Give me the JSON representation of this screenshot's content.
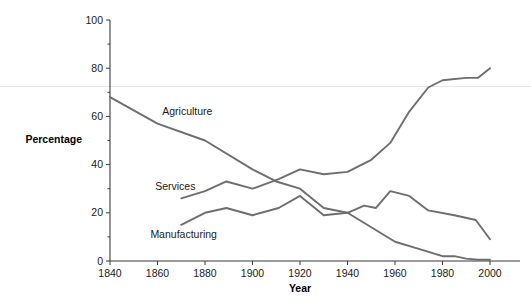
{
  "chart_data": {
    "type": "line",
    "title": "",
    "xlabel": "Year",
    "ylabel": "Percentage",
    "xlim": [
      1840,
      2000
    ],
    "ylim": [
      0,
      100
    ],
    "xticks": [
      1840,
      1860,
      1880,
      1900,
      1920,
      1940,
      1960,
      1980,
      2000
    ],
    "xtick_labels": [
      "1840",
      "1860",
      "1880",
      "1900",
      "1920",
      "1940",
      "1960",
      "1980",
      "2000"
    ],
    "yticks": [
      0,
      20,
      40,
      60,
      80,
      100
    ],
    "ytick_labels": [
      "0",
      "20",
      "40",
      "60",
      "80",
      "100"
    ],
    "yminorticks": [
      10,
      30,
      50,
      70,
      90
    ],
    "grid": false,
    "legend_position": "inline-labels",
    "line_color": "#6e6e6e",
    "series": [
      {
        "name": "Agriculture",
        "label": "Agriculture",
        "label_x": 1862,
        "label_y": 62,
        "x": [
          1840,
          1860,
          1880,
          1900,
          1910,
          1920,
          1930,
          1940,
          1950,
          1960,
          1970,
          1980,
          1985,
          1990,
          1995,
          2000
        ],
        "y": [
          68,
          57,
          50,
          38,
          33,
          30,
          22,
          20,
          14,
          8,
          5,
          2,
          2,
          1,
          0.5,
          0.5
        ]
      },
      {
        "name": "Services",
        "label": "Services",
        "label_x": 1859,
        "label_y": 31,
        "x": [
          1870,
          1880,
          1889,
          1900,
          1911,
          1920,
          1930,
          1940,
          1950,
          1958,
          1966,
          1974,
          1980,
          1990,
          1995,
          2000
        ],
        "y": [
          26,
          29,
          33,
          30,
          34,
          38,
          36,
          37,
          42,
          49,
          62,
          72,
          75,
          76,
          76,
          80
        ]
      },
      {
        "name": "Manufacturing",
        "label": "Manufacturing",
        "label_x": 1857,
        "label_y": 11,
        "x": [
          1870,
          1880,
          1889,
          1900,
          1911,
          1920,
          1930,
          1940,
          1947,
          1952,
          1958,
          1966,
          1974,
          1985,
          1994,
          2000
        ],
        "y": [
          15,
          20,
          22,
          19,
          22,
          27,
          19,
          20,
          23,
          22,
          29,
          27,
          21,
          19,
          17,
          9
        ]
      }
    ]
  },
  "axes": {
    "y_axis_title": "Percentage",
    "x_axis_title": "Year"
  }
}
